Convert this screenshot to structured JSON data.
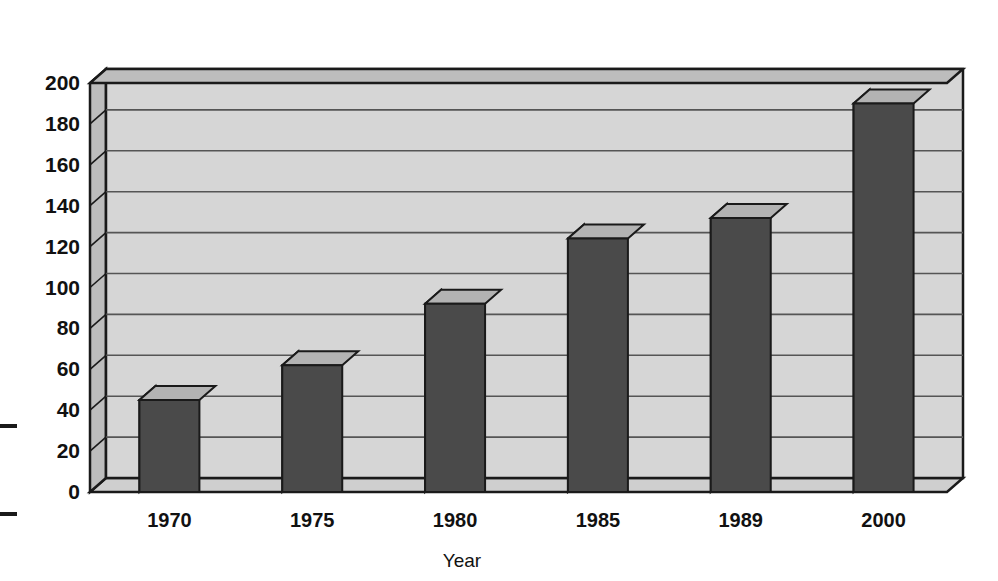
{
  "chart_data": {
    "type": "bar",
    "title": "",
    "subtitle": "",
    "xlabel": "Year",
    "ylabel": "",
    "categories": [
      "1970",
      "1975",
      "1980",
      "1985",
      "1989",
      "2000"
    ],
    "values": [
      35,
      55,
      85,
      115,
      125,
      180
    ],
    "values_back": [
      45,
      62,
      92,
      124,
      134,
      190
    ],
    "ylim": [
      0,
      200
    ],
    "ytick_step": 20,
    "yticks": [
      "0",
      "20",
      "40",
      "60",
      "80",
      "100",
      "120",
      "140",
      "160",
      "180",
      "200"
    ],
    "grid": true,
    "legend": false,
    "legend_position": "none",
    "style": "3d-column",
    "series": [
      {
        "name": "Value",
        "values": [
          35,
          55,
          85,
          115,
          125,
          180
        ]
      }
    ],
    "colors": {
      "bar_front": "#4a4a4a",
      "bar_top": "#b3b3b3",
      "bar_side": "#b3b3b3",
      "plot_background": "#d6d6d6",
      "wall_shade": "#bdbdbd",
      "floor": "#cfcfcf",
      "gridline": "#555555",
      "outline": "#1a1a1a",
      "page_background": "#ffffff",
      "text": "#111111"
    }
  },
  "axis": {
    "x_title": "Year",
    "y_title": ""
  },
  "marks": {
    "edge_tick_upper": "–",
    "edge_tick_lower": "–"
  }
}
